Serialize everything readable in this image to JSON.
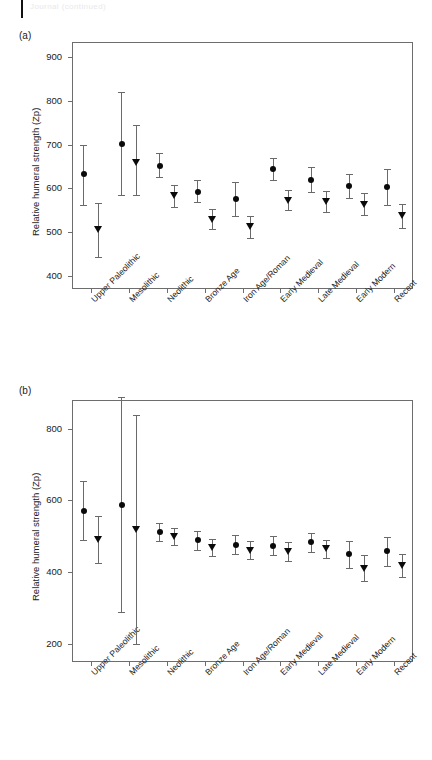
{
  "figure": {
    "top_partial_text": "Journal (continued)",
    "categories": [
      "Upper Paleolithic",
      "Mesolithic",
      "Neolithic",
      "Bronze Age",
      "Iron Age/Roman",
      "Early Medieval",
      "Late Medieval",
      "Early Modern",
      "Recent"
    ],
    "series_names": [
      "Males (filled circle)",
      "Females (open triangle)"
    ],
    "marker_male": "filled-circle",
    "marker_female": "open-triangle-down"
  },
  "chart_data": [
    {
      "type": "scatter",
      "panel": "(a)",
      "title": "",
      "xlabel": "",
      "ylabel": "Relative humeral strength (Zp)",
      "ylim": [
        370,
        935
      ],
      "yticks": [
        400,
        500,
        600,
        700,
        800,
        900
      ],
      "ytick_labels": [
        "400",
        "500",
        "600",
        "700",
        "800",
        "900"
      ],
      "grid": false,
      "legend": "none",
      "categories": [
        "Upper Paleolithic",
        "Mesolithic",
        "Neolithic",
        "Bronze Age",
        "Iron Age/Roman",
        "Early Medieval",
        "Late Medieval",
        "Early Modern",
        "Recent"
      ],
      "series": [
        {
          "name": "Males",
          "marker": "filled-circle",
          "values": [
            632,
            702,
            652,
            593,
            576,
            645,
            620,
            606,
            603
          ],
          "err_low": [
            563,
            584,
            626,
            568,
            538,
            620,
            592,
            578,
            563
          ],
          "err_high": [
            700,
            820,
            681,
            619,
            614,
            670,
            648,
            634,
            644
          ]
        },
        {
          "name": "Females",
          "marker": "open-triangle",
          "values": [
            505,
            659,
            583,
            530,
            512,
            573,
            570,
            564,
            537
          ],
          "err_low": [
            443,
            584,
            558,
            508,
            487,
            551,
            545,
            539,
            510
          ],
          "err_high": [
            566,
            744,
            608,
            552,
            538,
            596,
            595,
            589,
            565
          ]
        }
      ]
    },
    {
      "type": "scatter",
      "panel": "(b)",
      "title": "",
      "xlabel": "",
      "ylabel": "Relative humeral strength (Zp)",
      "ylim": [
        150,
        880
      ],
      "yticks": [
        200,
        400,
        600,
        800
      ],
      "ytick_labels": [
        "200",
        "400",
        "600",
        "800"
      ],
      "grid": false,
      "legend": "none",
      "categories": [
        "Upper Paleolithic",
        "Mesolithic",
        "Neolithic",
        "Bronze Age",
        "Iron Age/Roman",
        "Early Medieval",
        "Late Medieval",
        "Early Modern",
        "Recent"
      ],
      "series": [
        {
          "name": "Males",
          "marker": "filled-circle",
          "values": [
            571,
            588,
            513,
            489,
            477,
            474,
            483,
            450,
            458
          ],
          "err_low": [
            489,
            288,
            487,
            462,
            451,
            447,
            457,
            412,
            417
          ],
          "err_high": [
            655,
            888,
            538,
            515,
            503,
            500,
            509,
            488,
            499
          ]
        },
        {
          "name": "Females",
          "marker": "open-triangle",
          "values": [
            492,
            519,
            500,
            469,
            462,
            458,
            465,
            411,
            420
          ],
          "err_low": [
            426,
            200,
            476,
            445,
            437,
            432,
            440,
            375,
            387
          ],
          "err_high": [
            557,
            838,
            524,
            493,
            487,
            484,
            490,
            447,
            452
          ]
        }
      ]
    }
  ],
  "panel_a": {
    "label": "(a)"
  },
  "panel_b": {
    "label": "(b)"
  }
}
